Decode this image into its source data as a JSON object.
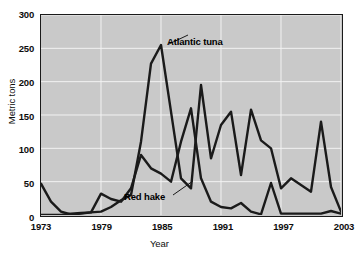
{
  "chart_data": {
    "type": "line",
    "title": "",
    "xlabel": "Year",
    "ylabel": "Metric tons",
    "xlim": [
      1973,
      2003
    ],
    "ylim": [
      0,
      300
    ],
    "ytick_values": [
      0,
      50,
      100,
      150,
      200,
      250,
      300
    ],
    "ytick_labels": [
      "0",
      "50",
      "100",
      "150",
      "200",
      "250",
      "300"
    ],
    "xtick_values": [
      1973,
      1979,
      1985,
      1991,
      1997,
      2003
    ],
    "xtick_labels": [
      "1973",
      "1979",
      "1985",
      "1991",
      "1997",
      "2003"
    ],
    "grid": true,
    "grid_color": "#f2f2f2",
    "plot_background": "#c9c9c9",
    "line_color": "#1a1a1a",
    "legend_position": "inline-annotations",
    "x": [
      1973,
      1974,
      1975,
      1976,
      1977,
      1978,
      1979,
      1980,
      1981,
      1982,
      1983,
      1984,
      1985,
      1986,
      1987,
      1988,
      1989,
      1990,
      1991,
      1992,
      1993,
      1994,
      1995,
      1996,
      1997,
      1998,
      1999,
      2000,
      2001,
      2002,
      2003
    ],
    "series": [
      {
        "name": "Atlantic tuna",
        "label": "Atlantic tuna",
        "values": [
          0,
          0,
          0,
          2,
          3,
          4,
          5,
          12,
          22,
          30,
          110,
          227,
          255,
          155,
          55,
          40,
          195,
          85,
          135,
          155,
          60,
          158,
          112,
          100,
          40,
          55,
          45,
          35,
          140,
          42,
          5
        ]
      },
      {
        "name": "Red hake",
        "label": "Red hake",
        "values": [
          47,
          20,
          5,
          1,
          2,
          4,
          32,
          24,
          20,
          40,
          90,
          70,
          62,
          50,
          110,
          160,
          55,
          20,
          12,
          10,
          18,
          5,
          1,
          48,
          2,
          2,
          2,
          2,
          2,
          6,
          2
        ]
      }
    ],
    "annotations": [
      {
        "text": "Atlantic tuna",
        "anchor_year": 1985,
        "anchor_value": 255
      },
      {
        "text": "Red hake",
        "anchor_year": 1988,
        "anchor_value": 62
      }
    ]
  },
  "axes": {
    "y_title": "Metric tons",
    "x_title": "Year"
  }
}
